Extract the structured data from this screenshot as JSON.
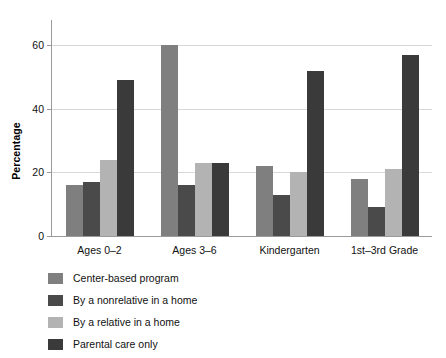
{
  "chart_data": {
    "type": "bar",
    "title": "",
    "xlabel": "",
    "ylabel": "Percentage",
    "ylim": [
      0,
      68
    ],
    "yticks": [
      0,
      20,
      40,
      60
    ],
    "ytick_labels": [
      "0",
      "20",
      "40",
      "60"
    ],
    "grid": "horizontal",
    "legend_position": "below",
    "categories": [
      "Ages 0–2",
      "Ages 3–6",
      "Kindergarten",
      "1st–3rd Grade"
    ],
    "series": [
      {
        "name": "Center-based program",
        "color": "#7f7f7f",
        "values": [
          16,
          60,
          22,
          18
        ]
      },
      {
        "name": "By a nonrelative in a home",
        "color": "#4a4a4a",
        "values": [
          17,
          16,
          13,
          9
        ]
      },
      {
        "name": "By a relative in a home",
        "color": "#b3b3b3",
        "values": [
          24,
          23,
          20,
          21
        ]
      },
      {
        "name": "Parental care only",
        "color": "#3a3a3a",
        "values": [
          49,
          23,
          52,
          57
        ]
      }
    ]
  },
  "axis_style": {
    "axis_color": "#9a9a9a",
    "grid_color": "#d8d8d8",
    "background": "#ffffff"
  }
}
